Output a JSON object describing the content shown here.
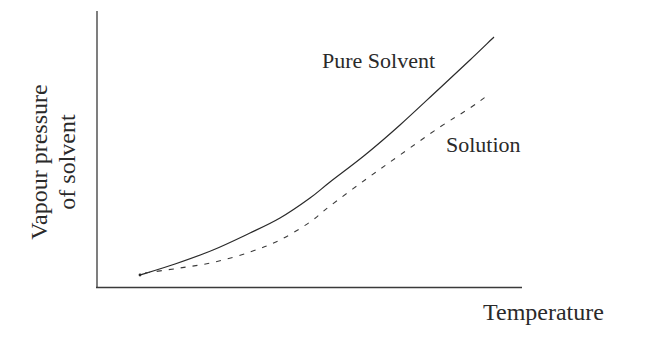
{
  "chart_data": {
    "type": "line",
    "title": "",
    "xlabel": "Temperature",
    "ylabel_lines": [
      "Vapour pressure",
      "of solvent"
    ],
    "ylabel": "Vapour pressure of solvent",
    "grid": false,
    "legend": "inline labels",
    "axis_ticks": "none",
    "series": [
      {
        "name": "Pure Solvent",
        "style": "solid",
        "points_px": [
          [
            140,
            275
          ],
          [
            175,
            264
          ],
          [
            213,
            250
          ],
          [
            250,
            233
          ],
          [
            280,
            218
          ],
          [
            310,
            198
          ],
          [
            330,
            182
          ],
          [
            365,
            155
          ],
          [
            400,
            125
          ],
          [
            440,
            88
          ],
          [
            470,
            60
          ],
          [
            494,
            37
          ]
        ]
      },
      {
        "name": "Solution",
        "style": "dashed",
        "points_px": [
          [
            145,
            273
          ],
          [
            180,
            268
          ],
          [
            215,
            262
          ],
          [
            250,
            252
          ],
          [
            280,
            240
          ],
          [
            310,
            222
          ],
          [
            330,
            206
          ],
          [
            365,
            180
          ],
          [
            400,
            155
          ],
          [
            440,
            127
          ],
          [
            470,
            108
          ],
          [
            488,
            95
          ]
        ]
      }
    ],
    "annotations": [
      {
        "text": "Pure Solvent",
        "near_series": "Pure Solvent"
      },
      {
        "text": "Solution",
        "near_series": "Solution"
      }
    ]
  },
  "labels": {
    "pure_solvent": "Pure Solvent",
    "solution": "Solution",
    "x_axis": "Temperature",
    "y_axis_line1": "Vapour pressure",
    "y_axis_line2": "of solvent"
  },
  "colors": {
    "ink": "#2a2a2a",
    "background": "#ffffff"
  }
}
